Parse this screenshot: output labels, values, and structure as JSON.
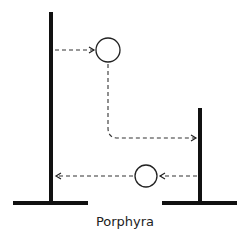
{
  "diagram": {
    "label": "Porphyra",
    "colors": {
      "stroke": "#111111",
      "dash": "#333333",
      "background": "#ffffff"
    },
    "elements": [
      {
        "type": "pole",
        "name": "left-pole"
      },
      {
        "type": "pole",
        "name": "right-pole"
      },
      {
        "type": "circle",
        "name": "upper-circle"
      },
      {
        "type": "circle",
        "name": "lower-circle"
      },
      {
        "type": "arrow",
        "from": "left-pole",
        "to": "upper-circle"
      },
      {
        "type": "arrow",
        "from": "upper-circle",
        "to": "right-pole"
      },
      {
        "type": "arrow",
        "from": "right-pole",
        "to": "lower-circle"
      },
      {
        "type": "arrow",
        "from": "lower-circle",
        "to": "left-pole"
      }
    ]
  }
}
